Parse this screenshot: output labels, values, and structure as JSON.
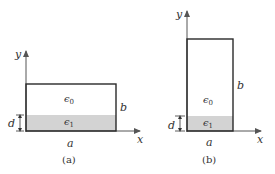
{
  "colors": {
    "stroke": "#2a2a2a",
    "shade": "#d3d3d3",
    "text": "#333333",
    "axis": "#555555"
  },
  "panels": [
    {
      "caption": "(a)",
      "axis_x_label": "x",
      "axis_y_label": "y",
      "width_label": "a",
      "height_label": "b",
      "layer_label": "d",
      "region_top_label": "ε0",
      "region_bottom_label": "ε1",
      "orientation": "wide"
    },
    {
      "caption": "(b)",
      "axis_x_label": "x",
      "axis_y_label": "y",
      "width_label": "a",
      "height_label": "b",
      "layer_label": "d",
      "region_top_label": "ε0",
      "region_bottom_label": "ε1",
      "orientation": "tall"
    }
  ],
  "symbols": {
    "epsilon": "ϵ",
    "sub0": "0",
    "sub1": "1"
  }
}
